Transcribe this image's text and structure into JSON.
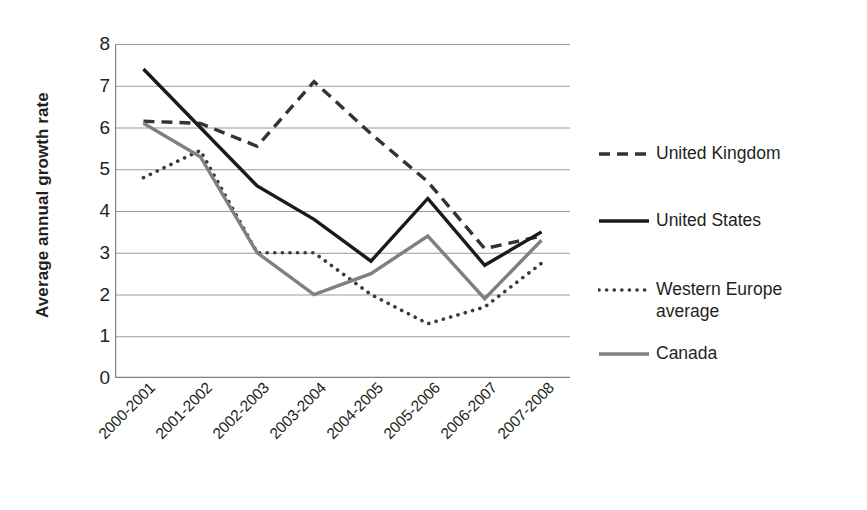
{
  "chart_data": {
    "type": "line",
    "title": "",
    "xlabel": "",
    "ylabel": "Average annual growth rate",
    "ylim": [
      0,
      8
    ],
    "ytick_values": [
      8,
      7,
      6,
      5,
      4,
      3,
      2,
      1,
      0
    ],
    "grid": true,
    "legend_position": "right",
    "categories": [
      "2000-2001",
      "2001-2002",
      "2002-2003",
      "2003-2004",
      "2004-2005",
      "2005-2006",
      "2006-2007",
      "2007-2008"
    ],
    "series": [
      {
        "name": "United Kingdom",
        "style": "dashed",
        "color": "#333333",
        "width": 3.4,
        "dash": "11,7",
        "values": [
          6.15,
          6.1,
          5.55,
          7.1,
          5.85,
          4.7,
          3.1,
          3.4
        ]
      },
      {
        "name": "United States",
        "style": "solid",
        "color": "#1a1a1a",
        "width": 3.4,
        "dash": "",
        "values": [
          7.4,
          6.0,
          4.6,
          3.8,
          2.8,
          4.3,
          2.7,
          3.5
        ]
      },
      {
        "name": "Western Europe average",
        "style": "dotted",
        "color": "#3a3a3a",
        "width": 3.6,
        "dash": "0.1,7.5",
        "values": [
          4.8,
          5.45,
          3.0,
          3.0,
          2.0,
          1.3,
          1.7,
          2.75
        ]
      },
      {
        "name": "Canada",
        "style": "solid",
        "color": "#808080",
        "width": 3.4,
        "dash": "",
        "values": [
          6.1,
          5.3,
          3.0,
          2.0,
          2.5,
          3.4,
          1.9,
          3.3
        ]
      }
    ]
  },
  "legend": {
    "items": [
      {
        "label": "United Kingdom"
      },
      {
        "label": "United States"
      },
      {
        "label": "Western Europe\naverage"
      },
      {
        "label": "Canada"
      }
    ]
  },
  "axis": {
    "y_title": "Average annual growth rate",
    "axis_color": "#808080",
    "grid_color": "#9a9a9a"
  }
}
